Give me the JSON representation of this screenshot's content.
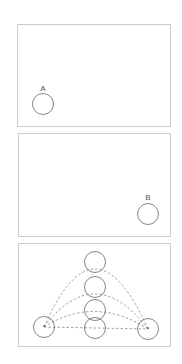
{
  "panels": [
    {
      "name": "panel-a",
      "label": "A"
    },
    {
      "name": "panel-b",
      "label": "B"
    },
    {
      "name": "panel-paths",
      "label": ""
    }
  ],
  "colors": {
    "frame": "#cccccc",
    "stroke": "#555555",
    "dash": "#777777"
  }
}
